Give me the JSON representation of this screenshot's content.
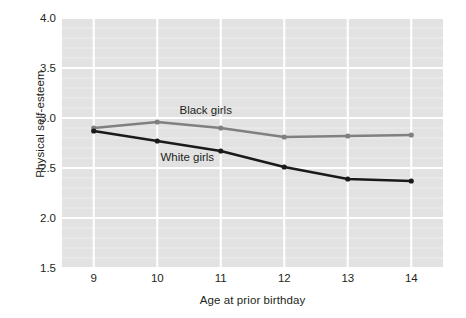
{
  "chart_data": {
    "type": "line",
    "title": "",
    "xlabel": "Age at prior birthday",
    "ylabel": "Physical self-esteem",
    "x": [
      9,
      10,
      11,
      12,
      13,
      14
    ],
    "xticklabels": [
      "9",
      "10",
      "11",
      "12",
      "13",
      "14"
    ],
    "xlim": [
      8.5,
      14.5
    ],
    "ylim": [
      1.5,
      4.0
    ],
    "yticks": [
      1.5,
      2.0,
      2.5,
      3.0,
      3.5,
      4.0
    ],
    "yticklabels": [
      "1.5",
      "2.0",
      "2.5",
      "3.0",
      "3.5",
      "4.0"
    ],
    "y_minor_step": 0.1,
    "grid": "white gridlines on gray panel; major horizontal and vertical at ticks, minor horizontal every 0.1",
    "legend": "inline annotations next to lines",
    "plot_background": "#e2e2e2",
    "figure_background": "#ffffff",
    "gridline_color": "#ffffff",
    "series": [
      {
        "name": "Black girls",
        "color": "#808080",
        "marker": "circle",
        "values": [
          2.9,
          2.96,
          2.9,
          2.81,
          2.82,
          2.83
        ],
        "label_position": "above line between x=10 and x=11"
      },
      {
        "name": "White girls",
        "color": "#1a1a1a",
        "marker": "circle",
        "values": [
          2.87,
          2.77,
          2.67,
          2.51,
          2.39,
          2.37
        ],
        "label_position": "below line between x=10 and x=11"
      }
    ],
    "annotations": [
      {
        "text": "Black girls",
        "x": 10.35,
        "y": 3.07
      },
      {
        "text": "White girls",
        "x": 10.05,
        "y": 2.6
      }
    ]
  }
}
